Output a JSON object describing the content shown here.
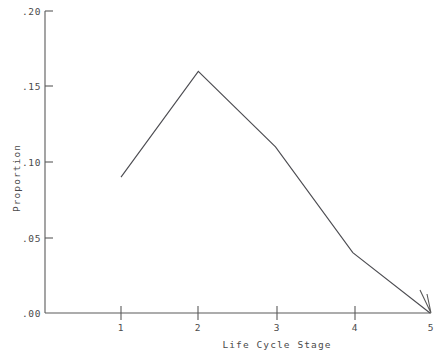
{
  "chart_data": {
    "type": "line",
    "title": "",
    "xlabel": "Life Cycle Stage",
    "ylabel": "Proportion",
    "x": [
      1,
      2,
      3,
      4,
      5
    ],
    "values": [
      0.09,
      0.16,
      0.11,
      0.04,
      0.0
    ],
    "categories": [
      "1",
      "2",
      "3",
      "4",
      "5"
    ],
    "xtick_labels": [
      "1",
      "2",
      "3",
      "4",
      "5"
    ],
    "ytick_labels": [
      ".00",
      ".05",
      ".10",
      ".15",
      ".20"
    ],
    "ytick_values": [
      0.0,
      0.05,
      0.1,
      0.15,
      0.2
    ],
    "ylim": [
      0.0,
      0.2
    ],
    "xlim": [
      0.6,
      5.0
    ],
    "grid": false,
    "legend": null,
    "line_color": "#4d4d52",
    "axis_color": "#5a5a5a",
    "background_color": "#ffffff",
    "annotations": []
  },
  "axis": {
    "y_label": "Proportion",
    "x_label": "Life Cycle Stage",
    "y_ticks": [
      {
        "label": ".20",
        "value": 0.2
      },
      {
        "label": ".15",
        "value": 0.15
      },
      {
        "label": ".10",
        "value": 0.1
      },
      {
        "label": ".05",
        "value": 0.05
      },
      {
        "label": ".00",
        "value": 0.0
      }
    ],
    "x_ticks": [
      {
        "label": "1",
        "value": 1
      },
      {
        "label": "2",
        "value": 2
      },
      {
        "label": "3",
        "value": 3
      },
      {
        "label": "4",
        "value": 4
      },
      {
        "label": "5",
        "value": 5
      }
    ]
  }
}
